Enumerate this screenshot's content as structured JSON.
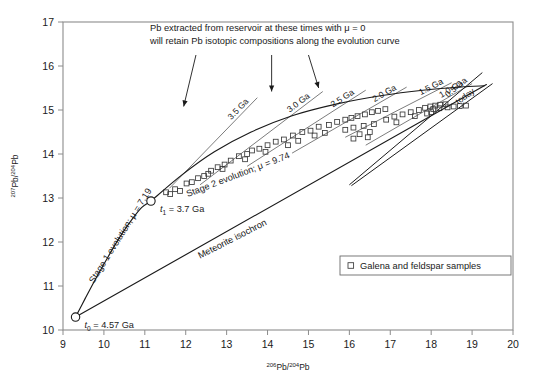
{
  "chart_data": {
    "type": "line",
    "title": "",
    "xlabel": "206Pb/204Pb",
    "ylabel": "207Pb/204Pb",
    "xlabel_parts": {
      "sup": "206",
      "mid": "Pb/",
      "sup2": "204",
      "tail": "Pb"
    },
    "ylabel_parts": {
      "sup": "207",
      "mid": "Pb/",
      "sup2": "204",
      "tail": "Pb"
    },
    "xlim": [
      9,
      20
    ],
    "ylim": [
      10,
      17
    ],
    "xticks": [
      9,
      10,
      11,
      12,
      13,
      14,
      15,
      16,
      17,
      18,
      19,
      20
    ],
    "yticks": [
      10,
      11,
      12,
      13,
      14,
      15,
      16,
      17
    ],
    "grid": false,
    "legend_position": "inside-lower-right",
    "series": [
      {
        "name": "Stage 1 evolution",
        "mu": 7.19,
        "kind": "growth-curve",
        "points": [
          [
            9.307,
            10.294
          ],
          [
            9.55,
            10.73
          ],
          [
            9.82,
            11.2
          ],
          [
            10.1,
            11.66
          ],
          [
            10.38,
            12.1
          ],
          [
            10.66,
            12.48
          ],
          [
            10.92,
            12.78
          ],
          [
            11.15,
            12.93
          ]
        ]
      },
      {
        "name": "Stage 2 evolution",
        "mu": 9.74,
        "kind": "growth-curve",
        "points": [
          [
            11.15,
            12.93
          ],
          [
            11.9,
            13.52
          ],
          [
            12.7,
            14.05
          ],
          [
            13.6,
            14.5
          ],
          [
            14.6,
            14.87
          ],
          [
            15.7,
            15.14
          ],
          [
            16.8,
            15.33
          ],
          [
            17.8,
            15.45
          ],
          [
            18.7,
            15.52
          ],
          [
            19.3,
            15.55
          ]
        ]
      },
      {
        "name": "Meteorite isochron",
        "kind": "line",
        "points": [
          [
            9.307,
            10.294
          ],
          [
            19.35,
            15.58
          ]
        ]
      }
    ],
    "nodes": [
      {
        "label": "t0 = 4.57 Ga",
        "t_sub": "0",
        "t_value": "= 4.57 Ga",
        "x": 9.307,
        "y": 10.294
      },
      {
        "label": "t1 = 3.7 Ga",
        "t_sub": "1",
        "t_value": "= 3.7 Ga",
        "x": 11.15,
        "y": 12.93
      }
    ],
    "isochrons": [
      {
        "label": "3.5 Ga",
        "age_ga": 3.5,
        "x0": 11.6,
        "y0": 13.22,
        "x1": 13.75,
        "y1": 15.28
      },
      {
        "label": "3.0 Ga",
        "age_ga": 3.0,
        "x0": 12.35,
        "y0": 13.3,
        "x1": 15.35,
        "y1": 15.42
      },
      {
        "label": "2.5 Ga",
        "age_ga": 2.5,
        "x0": 13.5,
        "y0": 13.72,
        "x1": 16.4,
        "y1": 15.45
      },
      {
        "label": "2.0 Ga",
        "age_ga": 2.0,
        "x0": 14.6,
        "y0": 14.02,
        "x1": 17.4,
        "y1": 15.52
      },
      {
        "label": "1.5 Ga",
        "age_ga": 1.5,
        "x0": 15.9,
        "y0": 14.38,
        "x1": 18.5,
        "y1": 15.62
      },
      {
        "label": "1.0 Ga",
        "age_ga": 1.0,
        "x0": 16.4,
        "y0": 14.2,
        "x1": 19.0,
        "y1": 15.6
      },
      {
        "label": "0.5 Ga",
        "age_ga": 0.5,
        "x0": 16.0,
        "y0": 13.3,
        "x1": 19.25,
        "y1": 15.85
      },
      {
        "label": "today",
        "age_ga": 0.0,
        "x0": 16.05,
        "y0": 13.28,
        "x1": 19.5,
        "y1": 15.6
      }
    ],
    "samples": [
      [
        11.52,
        13.13
      ],
      [
        11.62,
        13.09
      ],
      [
        11.74,
        13.2
      ],
      [
        11.86,
        13.16
      ],
      [
        12.02,
        13.33
      ],
      [
        12.15,
        13.36
      ],
      [
        12.3,
        13.45
      ],
      [
        12.45,
        13.5
      ],
      [
        12.62,
        13.62
      ],
      [
        12.78,
        13.7
      ],
      [
        12.95,
        13.76
      ],
      [
        13.1,
        13.85
      ],
      [
        13.3,
        13.95
      ],
      [
        13.5,
        14.0
      ],
      [
        13.62,
        14.08
      ],
      [
        13.8,
        14.12
      ],
      [
        14.0,
        14.2
      ],
      [
        14.2,
        14.28
      ],
      [
        14.4,
        14.33
      ],
      [
        14.62,
        14.42
      ],
      [
        14.85,
        14.5
      ],
      [
        15.05,
        14.53
      ],
      [
        15.25,
        14.62
      ],
      [
        15.5,
        14.66
      ],
      [
        15.7,
        14.73
      ],
      [
        15.9,
        14.78
      ],
      [
        16.05,
        14.82
      ],
      [
        16.2,
        14.86
      ],
      [
        16.38,
        14.9
      ],
      [
        16.55,
        14.95
      ],
      [
        16.7,
        14.98
      ],
      [
        16.88,
        15.02
      ],
      [
        15.9,
        14.55
      ],
      [
        16.1,
        14.6
      ],
      [
        16.35,
        14.64
      ],
      [
        16.6,
        14.68
      ],
      [
        16.25,
        14.45
      ],
      [
        16.5,
        14.5
      ],
      [
        16.9,
        14.78
      ],
      [
        17.1,
        14.85
      ],
      [
        17.3,
        14.9
      ],
      [
        17.5,
        14.95
      ],
      [
        17.7,
        15.0
      ],
      [
        17.85,
        15.05
      ],
      [
        17.98,
        15.08
      ],
      [
        18.1,
        15.1
      ],
      [
        18.22,
        15.12
      ],
      [
        18.35,
        15.13
      ],
      [
        18.05,
        15.02
      ],
      [
        18.2,
        15.04
      ],
      [
        18.4,
        15.06
      ],
      [
        18.55,
        15.08
      ],
      [
        18.7,
        15.09
      ],
      [
        18.85,
        15.1
      ],
      [
        17.6,
        14.86
      ],
      [
        17.9,
        14.92
      ],
      [
        15.15,
        14.42
      ],
      [
        15.4,
        14.48
      ],
      [
        14.75,
        14.3
      ],
      [
        14.5,
        14.2
      ],
      [
        13.95,
        14.05
      ],
      [
        13.45,
        13.88
      ],
      [
        12.9,
        13.66
      ],
      [
        12.55,
        13.55
      ],
      [
        16.1,
        14.35
      ],
      [
        16.45,
        14.38
      ],
      [
        17.15,
        14.72
      ],
      [
        18.0,
        14.95
      ]
    ],
    "annotations": [
      {
        "id": "reservoir-note",
        "line1": "Pb extracted from reservoir at these times with μ = 0",
        "line2": "will retain Pb isotopic compositions along the evolution curve"
      },
      {
        "id": "stage1-label",
        "text": "Stage 1 evolution; μ = 7.19"
      },
      {
        "id": "stage2-label",
        "text": "Stage 2 evolution; μ = 9.74"
      },
      {
        "id": "meteorite-label",
        "text": "Meteorite isochron"
      }
    ],
    "arrows": [
      {
        "from_x": 12.25,
        "from_y": 16.25,
        "to_x": 11.95,
        "to_y": 15.08
      },
      {
        "from_x": 14.1,
        "from_y": 16.25,
        "to_x": 14.1,
        "to_y": 15.42
      },
      {
        "from_x": 15.0,
        "from_y": 16.25,
        "to_x": 15.25,
        "to_y": 15.5
      }
    ],
    "legend": {
      "marker": "open-square",
      "label": "Galena and feldspar samples"
    }
  }
}
